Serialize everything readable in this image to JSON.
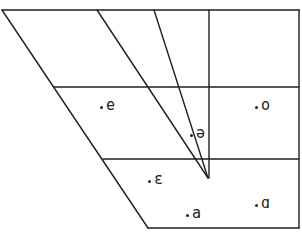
{
  "diagram": {
    "type": "vowel-quadrilateral",
    "line_color": "#1f1f1f",
    "vowels": [
      {
        "symbol": "e",
        "x": 100,
        "y": 98
      },
      {
        "symbol": "o",
        "x": 255,
        "y": 98
      },
      {
        "symbol": "ə",
        "x": 190,
        "y": 127
      },
      {
        "symbol": "ε",
        "x": 148,
        "y": 172
      },
      {
        "symbol": "a",
        "x": 186,
        "y": 206
      },
      {
        "symbol": "ɑ",
        "x": 255,
        "y": 196
      }
    ]
  }
}
